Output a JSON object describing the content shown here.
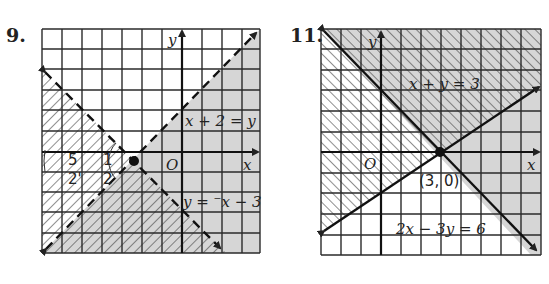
{
  "problems": [
    {
      "number": "9.",
      "equations": [
        "x + 2 = y",
        "y = ⁻x − 3"
      ],
      "axis_labels": {
        "x": "x",
        "y": "y",
        "origin": "O"
      },
      "angle_labels": [
        "5",
        "1",
        "2'",
        "2"
      ],
      "intersection_point": [
        -2.5,
        -0.5
      ],
      "boundary_styles": {
        "x + 2 = y": "dashed",
        "y = -x - 3": "dashed"
      }
    },
    {
      "number": "11.",
      "equations": [
        "x + y = 3",
        "2x − 3y = 6"
      ],
      "axis_labels": {
        "x": "x",
        "y": "y",
        "origin": "O"
      },
      "point_label": "(3, 0)",
      "intersection_point": [
        3,
        0
      ],
      "boundary_styles": {
        "x + y = 3": "solid",
        "2x - 3y = 6": "solid"
      }
    }
  ],
  "colors": {
    "grid": "#2a2a2a",
    "shade": "#d4d4d4",
    "hatch": "#333333",
    "background": "#ffffff"
  }
}
